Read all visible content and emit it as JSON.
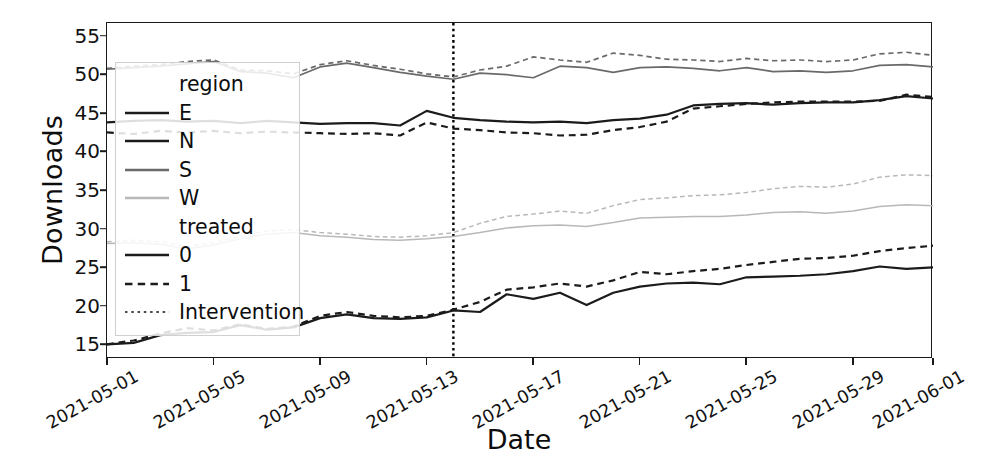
{
  "chart_data": {
    "type": "line",
    "title": "",
    "xlabel": "Date",
    "ylabel": "Downloads",
    "ylim": [
      13.2,
      56.8
    ],
    "yticks": [
      15,
      20,
      25,
      30,
      35,
      40,
      45,
      50,
      55
    ],
    "xlim": [
      "2021-05-01",
      "2021-06-01"
    ],
    "xticks": [
      "2021-05-01",
      "2021-05-05",
      "2021-05-09",
      "2021-05-13",
      "2021-05-17",
      "2021-05-21",
      "2021-05-25",
      "2021-05-29",
      "2021-06-01"
    ],
    "grid": false,
    "legend_position": "upper left",
    "legend_titles": [
      "region",
      "treated"
    ],
    "x": [
      "2021-05-01",
      "2021-05-02",
      "2021-05-03",
      "2021-05-04",
      "2021-05-05",
      "2021-05-06",
      "2021-05-07",
      "2021-05-08",
      "2021-05-09",
      "2021-05-10",
      "2021-05-11",
      "2021-05-12",
      "2021-05-13",
      "2021-05-14",
      "2021-05-15",
      "2021-05-16",
      "2021-05-17",
      "2021-05-18",
      "2021-05-19",
      "2021-05-20",
      "2021-05-21",
      "2021-05-22",
      "2021-05-23",
      "2021-05-24",
      "2021-05-25",
      "2021-05-26",
      "2021-05-27",
      "2021-05-28",
      "2021-05-29",
      "2021-05-30",
      "2021-05-31",
      "2021-06-01"
    ],
    "annotations": [
      {
        "type": "vline",
        "label": "Intervention",
        "x": "2021-05-14",
        "style": "dotted",
        "color": "#000000"
      }
    ],
    "series": [
      {
        "name": "E, treated=0",
        "region": "E",
        "treated": "0",
        "color": "#1b1b1b",
        "dash": "solid",
        "width": 2.2,
        "values": [
          15.1,
          15.3,
          16.3,
          16.6,
          16.7,
          17.6,
          17.0,
          17.3,
          18.5,
          19.0,
          18.5,
          18.4,
          18.6,
          19.5,
          19.3,
          21.6,
          21.0,
          21.8,
          20.2,
          21.8,
          22.6,
          23.0,
          23.1,
          22.9,
          23.8,
          23.9,
          24.0,
          24.2,
          24.6,
          25.2,
          24.9,
          25.1
        ]
      },
      {
        "name": "E, treated=1",
        "region": "E",
        "treated": "1",
        "color": "#1b1b1b",
        "dash": "dashed",
        "width": 2.2,
        "values": [
          15.1,
          15.6,
          16.5,
          17.2,
          16.9,
          17.7,
          17.1,
          17.4,
          18.8,
          19.3,
          18.8,
          18.6,
          18.8,
          19.6,
          20.6,
          22.2,
          22.5,
          23.0,
          22.6,
          23.4,
          24.5,
          24.2,
          24.6,
          24.9,
          25.4,
          25.8,
          26.2,
          26.3,
          26.6,
          27.2,
          27.6,
          27.9
        ]
      },
      {
        "name": "N, treated=0",
        "region": "N",
        "treated": "0",
        "color": "#1b1b1b",
        "dash": "solid",
        "width": 2.2,
        "values": [
          43.9,
          44.1,
          44.2,
          44.0,
          44.1,
          43.8,
          44.1,
          43.9,
          43.7,
          43.8,
          43.8,
          43.5,
          45.4,
          44.5,
          44.2,
          44.0,
          43.9,
          44.0,
          43.8,
          44.2,
          44.4,
          44.9,
          46.1,
          46.3,
          46.4,
          46.2,
          46.4,
          46.5,
          46.5,
          46.8,
          47.3,
          47.0
        ]
      },
      {
        "name": "N, treated=1",
        "region": "N",
        "treated": "1",
        "color": "#1b1b1b",
        "dash": "dashed",
        "width": 2.2,
        "values": [
          42.6,
          42.4,
          42.8,
          42.6,
          42.8,
          42.5,
          42.7,
          42.6,
          42.5,
          42.4,
          42.5,
          42.2,
          43.9,
          43.1,
          42.9,
          42.6,
          42.5,
          42.2,
          42.3,
          42.9,
          43.3,
          44.0,
          45.7,
          46.0,
          46.3,
          46.5,
          46.6,
          46.6,
          46.6,
          46.7,
          47.5,
          47.2
        ]
      },
      {
        "name": "S, treated=0",
        "region": "S",
        "treated": "0",
        "color": "#6a6a6a",
        "dash": "solid",
        "width": 1.7,
        "values": [
          50.8,
          51.0,
          51.2,
          51.5,
          51.8,
          50.5,
          50.3,
          49.7,
          51.1,
          51.6,
          51.0,
          50.4,
          49.9,
          49.5,
          50.3,
          50.1,
          49.7,
          51.2,
          51.0,
          50.4,
          51.0,
          51.1,
          50.9,
          50.6,
          51.0,
          50.5,
          50.6,
          50.4,
          50.6,
          51.3,
          51.4,
          51.1
        ]
      },
      {
        "name": "S, treated=1",
        "region": "S",
        "treated": "1",
        "color": "#6a6a6a",
        "dash": "dashed",
        "width": 1.7,
        "values": [
          50.9,
          51.2,
          51.4,
          51.8,
          52.0,
          50.7,
          50.6,
          50.2,
          51.4,
          51.9,
          51.3,
          50.8,
          50.2,
          49.8,
          50.7,
          51.2,
          52.4,
          52.0,
          51.7,
          52.9,
          52.6,
          52.1,
          52.0,
          51.8,
          52.2,
          51.9,
          52.0,
          51.8,
          52.0,
          52.8,
          53.0,
          52.6
        ]
      },
      {
        "name": "W, treated=0",
        "region": "W",
        "treated": "0",
        "color": "#b8b8b8",
        "dash": "solid",
        "width": 1.5,
        "values": [
          28.2,
          28.3,
          28.1,
          27.5,
          28.0,
          28.8,
          29.4,
          29.6,
          29.2,
          29.0,
          28.7,
          28.6,
          28.8,
          29.1,
          29.6,
          30.2,
          30.5,
          30.6,
          30.4,
          30.9,
          31.5,
          31.6,
          31.7,
          31.7,
          31.9,
          32.2,
          32.3,
          32.1,
          32.4,
          33.0,
          33.2,
          33.1
        ]
      },
      {
        "name": "W, treated=1",
        "region": "W",
        "treated": "1",
        "color": "#b8b8b8",
        "dash": "dashed",
        "width": 1.5,
        "values": [
          28.4,
          28.6,
          28.4,
          27.8,
          28.3,
          29.1,
          29.8,
          30.0,
          29.6,
          29.4,
          29.1,
          29.0,
          29.2,
          29.6,
          30.8,
          31.7,
          32.0,
          32.4,
          32.1,
          33.1,
          33.9,
          34.1,
          34.4,
          34.5,
          34.8,
          35.3,
          35.6,
          35.5,
          35.9,
          36.8,
          37.1,
          37.0
        ]
      }
    ],
    "legend_items": [
      {
        "label": "region",
        "kind": "title",
        "color": "#0d0d0d",
        "dash": "none"
      },
      {
        "label": "E",
        "kind": "swatch",
        "color": "#1b1b1b",
        "dash": "solid"
      },
      {
        "label": "N",
        "kind": "swatch",
        "color": "#1b1b1b",
        "dash": "solid"
      },
      {
        "label": "S",
        "kind": "swatch",
        "color": "#6a6a6a",
        "dash": "solid"
      },
      {
        "label": "W",
        "kind": "swatch",
        "color": "#b8b8b8",
        "dash": "solid"
      },
      {
        "label": "treated",
        "kind": "title",
        "color": "#0d0d0d",
        "dash": "none"
      },
      {
        "label": "0",
        "kind": "swatch",
        "color": "#1b1b1b",
        "dash": "solid"
      },
      {
        "label": "1",
        "kind": "swatch",
        "color": "#1b1b1b",
        "dash": "dashed"
      },
      {
        "label": "Intervention",
        "kind": "swatch",
        "color": "#4a4a4a",
        "dash": "dotted"
      }
    ]
  }
}
